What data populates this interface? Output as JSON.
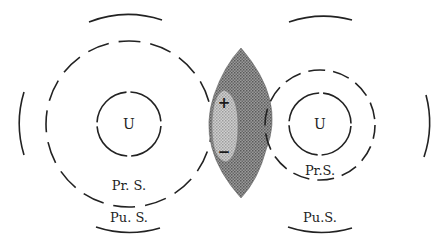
{
  "diagram": {
    "type": "two-system interaction schematic",
    "colors": {
      "line": "#222222",
      "lens_dark": "#7d7d7d",
      "lens_light": "#bdbdbd",
      "background": "#ffffff"
    },
    "left_system": {
      "core_label": "U",
      "primary_sphere_label": "Pr. S.",
      "public_sphere_label": "Pu. S."
    },
    "right_system": {
      "core_label": "U",
      "primary_sphere_label": "Pr.S.",
      "public_sphere_label": "Pu.S."
    },
    "overlap_zone": {
      "positive_sign": "+",
      "negative_sign": "−"
    }
  }
}
